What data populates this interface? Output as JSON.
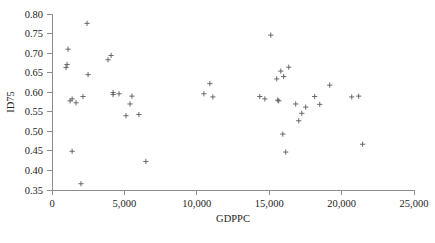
{
  "chart_data": {
    "type": "scatter",
    "title": "",
    "xlabel": "GDPPC",
    "ylabel": "ID75",
    "xlim": [
      0,
      25000
    ],
    "ylim": [
      0.35,
      0.8
    ],
    "grid": false,
    "legend": null,
    "marker": "plus",
    "marker_color": "#5a5a5a",
    "xticks": [
      0,
      5000,
      10000,
      15000,
      20000,
      25000
    ],
    "xtick_labels": [
      "0",
      "5,000",
      "10,000",
      "15,000",
      "20,000",
      "25,000"
    ],
    "yticks": [
      0.35,
      0.4,
      0.45,
      0.5,
      0.55,
      0.6,
      0.65,
      0.7,
      0.75,
      0.8
    ],
    "ytick_labels": [
      "0.35",
      "0.40",
      "0.45",
      "0.50",
      "0.55",
      "0.60",
      "0.65",
      "0.70",
      "0.75",
      "0.80"
    ],
    "points": [
      {
        "x": 970,
        "y": 0.663
      },
      {
        "x": 1040,
        "y": 0.671
      },
      {
        "x": 1110,
        "y": 0.71
      },
      {
        "x": 1250,
        "y": 0.578
      },
      {
        "x": 1390,
        "y": 0.583
      },
      {
        "x": 1390,
        "y": 0.449
      },
      {
        "x": 1660,
        "y": 0.573
      },
      {
        "x": 2000,
        "y": 0.366
      },
      {
        "x": 2140,
        "y": 0.589
      },
      {
        "x": 2420,
        "y": 0.776
      },
      {
        "x": 2490,
        "y": 0.645
      },
      {
        "x": 3870,
        "y": 0.683
      },
      {
        "x": 4080,
        "y": 0.694
      },
      {
        "x": 4220,
        "y": 0.594
      },
      {
        "x": 4220,
        "y": 0.599
      },
      {
        "x": 4630,
        "y": 0.596
      },
      {
        "x": 5110,
        "y": 0.54
      },
      {
        "x": 5390,
        "y": 0.57
      },
      {
        "x": 5520,
        "y": 0.59
      },
      {
        "x": 6000,
        "y": 0.543
      },
      {
        "x": 6480,
        "y": 0.423
      },
      {
        "x": 10490,
        "y": 0.596
      },
      {
        "x": 10900,
        "y": 0.622
      },
      {
        "x": 11110,
        "y": 0.588
      },
      {
        "x": 14350,
        "y": 0.589
      },
      {
        "x": 14700,
        "y": 0.583
      },
      {
        "x": 15110,
        "y": 0.746
      },
      {
        "x": 15520,
        "y": 0.634
      },
      {
        "x": 15590,
        "y": 0.58
      },
      {
        "x": 15660,
        "y": 0.578
      },
      {
        "x": 15800,
        "y": 0.654
      },
      {
        "x": 15940,
        "y": 0.493
      },
      {
        "x": 16000,
        "y": 0.64
      },
      {
        "x": 16140,
        "y": 0.447
      },
      {
        "x": 16350,
        "y": 0.664
      },
      {
        "x": 16830,
        "y": 0.57
      },
      {
        "x": 17040,
        "y": 0.527
      },
      {
        "x": 17250,
        "y": 0.546
      },
      {
        "x": 17520,
        "y": 0.562
      },
      {
        "x": 18140,
        "y": 0.589
      },
      {
        "x": 18490,
        "y": 0.569
      },
      {
        "x": 19180,
        "y": 0.618
      },
      {
        "x": 20700,
        "y": 0.588
      },
      {
        "x": 21180,
        "y": 0.59
      },
      {
        "x": 21450,
        "y": 0.467
      }
    ]
  },
  "figure": {
    "background_color": "#ffffff",
    "axis_color": "#8c8c8c",
    "text_color": "#232323"
  }
}
